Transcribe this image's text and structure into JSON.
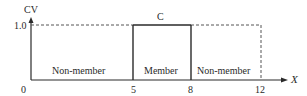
{
  "diagram": {
    "y_axis_label": "CV",
    "x_axis_label": "X",
    "y_tick_label": "1.0",
    "set_label": "C",
    "x_ticks": [
      "0",
      "5",
      "8",
      "12"
    ],
    "regions": [
      {
        "label": "Non-member",
        "from": 0,
        "to": 5
      },
      {
        "label": "Member",
        "from": 5,
        "to": 8
      },
      {
        "label": "Non-member",
        "from": 8,
        "to": 12
      }
    ],
    "colors": {
      "line": "#2a2a2a",
      "dashed": "#555555",
      "background": "#ffffff"
    }
  }
}
